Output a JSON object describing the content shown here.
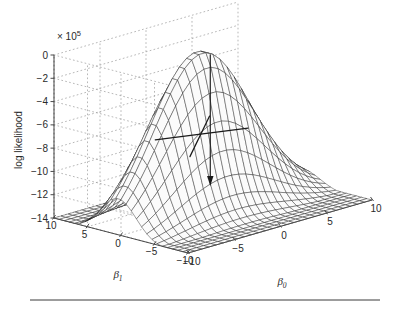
{
  "figure": {
    "kind": "surface-3d",
    "background_color": "#ffffff",
    "caption_rule": true
  },
  "axes": {
    "z": {
      "label": "log likelihood",
      "exponent_label": "× 10",
      "exponent_power": "5",
      "ticks": [
        0,
        -2,
        -4,
        -6,
        -8,
        -10,
        -12,
        -14
      ],
      "tick_labels": [
        "0",
        "−2",
        "−4",
        "−6",
        "−8",
        "−10",
        "−12",
        "−14"
      ],
      "range": [
        -14,
        0
      ]
    },
    "x": {
      "label": "β",
      "subscript": "0",
      "ticks": [
        -10,
        -5,
        0,
        5,
        10
      ],
      "tick_labels": [
        "−10",
        "−5",
        "0",
        "5",
        "10"
      ],
      "range": [
        -10,
        10
      ]
    },
    "y": {
      "label": "β",
      "subscript": "1",
      "ticks": [
        10,
        5,
        0,
        -5,
        -10
      ],
      "tick_labels": [
        "10",
        "5",
        "0",
        "−5",
        "−10"
      ],
      "range": [
        -10,
        10
      ]
    }
  },
  "annotation": {
    "marker": "cross-marker",
    "marker_beta0": -1.2,
    "marker_beta1": 0.4,
    "arrow": "down-arrow",
    "arrow_color": "#1a1a1a"
  },
  "style": {
    "mesh_color": "#1c1c1c",
    "grid_color": "#9a9a9a",
    "axis_color": "#4a4a4a",
    "surface_fill": "#fbfbfb"
  },
  "chart_data": {
    "type": "surface",
    "title": "",
    "xlabel": "β₀",
    "ylabel": "β₁",
    "zlabel": "log likelihood",
    "xlim": [
      -10,
      10
    ],
    "ylim": [
      -10,
      10
    ],
    "zlim": [
      -14,
      0
    ],
    "z_scale": "×10^5",
    "grid": true,
    "legend": false,
    "model": {
      "form": "z = -A*( (b0-b0max)^2 * s0 + (b1-b1max)^2 * s1 ) saturating toward the edges",
      "peak_z": -0.2,
      "peak_beta0": -1.2,
      "peak_beta1": 0.4,
      "amplitude": 14.0,
      "curvature_beta0": 0.03,
      "curvature_beta1": 0.115
    },
    "grid_size": {
      "nx": 26,
      "ny": 26
    },
    "z_at_corners": [
      {
        "beta0": -10,
        "beta1": -10,
        "z": -12.6
      },
      {
        "beta0": 10,
        "beta1": -10,
        "z": -8.6
      },
      {
        "beta0": -10,
        "beta1": 10,
        "z": -12.3
      },
      {
        "beta0": 10,
        "beta1": 10,
        "z": -8.3
      }
    ],
    "z_ridge_samples": [
      {
        "beta0": -10,
        "beta1": 0.4,
        "z": -2.6
      },
      {
        "beta0": -5,
        "beta1": 0.4,
        "z": -0.8
      },
      {
        "beta0": 0,
        "beta1": 0.4,
        "z": -0.25
      },
      {
        "beta0": 5,
        "beta1": 0.4,
        "z": -1.4
      },
      {
        "beta0": 10,
        "beta1": 0.4,
        "z": -3.9
      }
    ]
  }
}
